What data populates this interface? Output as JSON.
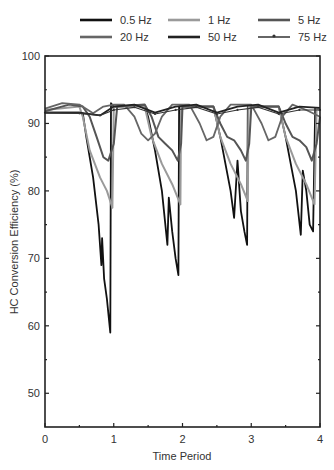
{
  "chart_data": {
    "type": "line",
    "title": "",
    "xlabel": "Time Period",
    "ylabel": "HC Conversion Efficiency (%)",
    "xlim": [
      0,
      4
    ],
    "ylim": [
      45,
      100
    ],
    "x_ticks": [
      0,
      1,
      2,
      3,
      4
    ],
    "y_ticks": [
      50,
      60,
      70,
      80,
      90,
      100
    ],
    "grid": false,
    "legend_position": "top",
    "legend": [
      "0.5 Hz",
      "1 Hz",
      "5 Hz",
      "20 Hz",
      "50 Hz",
      "75 Hz"
    ],
    "series": [
      {
        "name": "0.5 Hz",
        "color": "#111111",
        "points": [
          [
            0,
            91.6
          ],
          [
            0.5,
            91.6
          ],
          [
            0.55,
            91.5
          ],
          [
            0.6,
            88
          ],
          [
            0.7,
            82
          ],
          [
            0.78,
            75
          ],
          [
            0.82,
            69
          ],
          [
            0.83,
            73
          ],
          [
            0.86,
            67
          ],
          [
            0.9,
            64
          ],
          [
            0.95,
            59
          ],
          [
            0.96,
            93
          ],
          [
            1.0,
            92.5
          ],
          [
            1.45,
            92.6
          ],
          [
            1.5,
            91
          ],
          [
            1.6,
            86
          ],
          [
            1.7,
            80
          ],
          [
            1.78,
            72
          ],
          [
            1.8,
            79
          ],
          [
            1.85,
            74
          ],
          [
            1.9,
            70
          ],
          [
            1.94,
            67.5
          ],
          [
            1.95,
            92.5
          ],
          [
            2.45,
            92.5
          ],
          [
            2.55,
            88
          ],
          [
            2.7,
            80
          ],
          [
            2.75,
            76
          ],
          [
            2.8,
            84.5
          ],
          [
            2.85,
            77
          ],
          [
            2.9,
            74
          ],
          [
            2.94,
            72
          ],
          [
            2.95,
            92.5
          ],
          [
            3.4,
            92.5
          ],
          [
            3.5,
            88
          ],
          [
            3.65,
            80
          ],
          [
            3.72,
            73.5
          ],
          [
            3.75,
            83
          ],
          [
            3.8,
            80
          ],
          [
            3.85,
            75
          ],
          [
            3.9,
            74
          ],
          [
            3.93,
            92.3
          ],
          [
            4.0,
            92
          ]
        ]
      },
      {
        "name": "1 Hz",
        "color": "#9a9a9a",
        "points": [
          [
            0,
            92
          ],
          [
            0.5,
            92.5
          ],
          [
            0.55,
            91
          ],
          [
            0.65,
            86
          ],
          [
            0.8,
            82
          ],
          [
            0.9,
            80
          ],
          [
            0.98,
            77.5
          ],
          [
            1.0,
            92.5
          ],
          [
            1.45,
            92.5
          ],
          [
            1.55,
            88
          ],
          [
            1.7,
            84
          ],
          [
            1.85,
            81
          ],
          [
            1.97,
            78
          ],
          [
            1.98,
            92.5
          ],
          [
            2.45,
            92.5
          ],
          [
            2.55,
            88
          ],
          [
            2.7,
            84
          ],
          [
            2.85,
            81
          ],
          [
            2.95,
            78.5
          ],
          [
            2.96,
            92.5
          ],
          [
            3.4,
            92.5
          ],
          [
            3.5,
            88
          ],
          [
            3.65,
            84
          ],
          [
            3.8,
            81
          ],
          [
            3.92,
            78
          ],
          [
            3.95,
            92.3
          ],
          [
            4.0,
            92
          ]
        ]
      },
      {
        "name": "5 Hz",
        "color": "#555555",
        "points": [
          [
            0,
            91.8
          ],
          [
            0.35,
            92.8
          ],
          [
            0.55,
            92.5
          ],
          [
            0.65,
            91
          ],
          [
            0.75,
            88
          ],
          [
            0.85,
            85
          ],
          [
            0.92,
            84.5
          ],
          [
            1.0,
            87
          ],
          [
            1.05,
            92.5
          ],
          [
            1.45,
            92.8
          ],
          [
            1.55,
            91
          ],
          [
            1.65,
            88
          ],
          [
            1.75,
            87
          ],
          [
            1.85,
            86
          ],
          [
            1.93,
            84.5
          ],
          [
            1.98,
            87
          ],
          [
            2.0,
            92.5
          ],
          [
            2.45,
            92.5
          ],
          [
            2.55,
            90
          ],
          [
            2.65,
            88
          ],
          [
            2.75,
            87.5
          ],
          [
            2.85,
            86
          ],
          [
            2.92,
            84.5
          ],
          [
            2.97,
            87
          ],
          [
            3.0,
            92.5
          ],
          [
            3.4,
            92.5
          ],
          [
            3.5,
            90
          ],
          [
            3.6,
            88
          ],
          [
            3.7,
            87.5
          ],
          [
            3.8,
            86.5
          ],
          [
            3.88,
            84.5
          ],
          [
            3.95,
            87
          ],
          [
            4.0,
            91
          ]
        ]
      },
      {
        "name": "20 Hz",
        "color": "#666666",
        "points": [
          [
            0,
            92.2
          ],
          [
            0.25,
            93
          ],
          [
            0.5,
            92.8
          ],
          [
            0.7,
            91.5
          ],
          [
            0.85,
            92.5
          ],
          [
            1.0,
            92.8
          ],
          [
            1.15,
            92.8
          ],
          [
            1.3,
            91
          ],
          [
            1.4,
            88.5
          ],
          [
            1.5,
            87.5
          ],
          [
            1.6,
            88.5
          ],
          [
            1.7,
            91
          ],
          [
            1.85,
            92.8
          ],
          [
            2.1,
            92.8
          ],
          [
            2.25,
            90
          ],
          [
            2.35,
            87.5
          ],
          [
            2.45,
            88
          ],
          [
            2.55,
            91
          ],
          [
            2.7,
            92.8
          ],
          [
            3.0,
            92.8
          ],
          [
            3.15,
            90
          ],
          [
            3.25,
            87.5
          ],
          [
            3.35,
            88
          ],
          [
            3.45,
            91
          ],
          [
            3.6,
            92.8
          ],
          [
            3.8,
            92
          ],
          [
            4.0,
            91
          ]
        ]
      },
      {
        "name": "50 Hz",
        "color": "#222222",
        "points": [
          [
            0,
            91.6
          ],
          [
            0.5,
            91.6
          ],
          [
            0.8,
            91.2
          ],
          [
            1.0,
            92.5
          ],
          [
            1.3,
            92.8
          ],
          [
            1.6,
            91.6
          ],
          [
            1.9,
            92.5
          ],
          [
            2.2,
            92.8
          ],
          [
            2.5,
            91.6
          ],
          [
            2.8,
            92.5
          ],
          [
            3.1,
            92.8
          ],
          [
            3.4,
            91.6
          ],
          [
            3.7,
            92.5
          ],
          [
            4.0,
            92.3
          ]
        ]
      },
      {
        "name": "75 Hz",
        "color": "#333333",
        "marker": "dot",
        "points": [
          [
            0,
            91.6
          ],
          [
            0.5,
            91.5
          ],
          [
            0.8,
            91.2
          ],
          [
            1.0,
            92
          ],
          [
            1.3,
            92.4
          ],
          [
            1.6,
            91.4
          ],
          [
            1.9,
            92
          ],
          [
            2.2,
            92.4
          ],
          [
            2.5,
            91.4
          ],
          [
            2.8,
            92
          ],
          [
            3.1,
            92.4
          ],
          [
            3.4,
            91.4
          ],
          [
            3.7,
            92
          ],
          [
            4.0,
            92
          ]
        ]
      }
    ]
  }
}
